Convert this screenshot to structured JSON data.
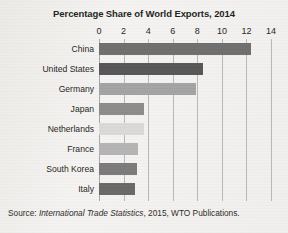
{
  "chart_data": {
    "type": "bar",
    "orientation": "horizontal",
    "title": "Percentage Share of World Exports, 2014",
    "xlabel": "",
    "ylabel": "",
    "xlim": [
      0,
      14
    ],
    "xticks": [
      0,
      2,
      4,
      6,
      8,
      10,
      12,
      14
    ],
    "grid": true,
    "legend": "none",
    "categories": [
      "China",
      "United States",
      "Germany",
      "Japan",
      "Netherlands",
      "France",
      "South Korea",
      "Italy"
    ],
    "values": [
      12.4,
      8.5,
      7.9,
      3.7,
      3.7,
      3.2,
      3.1,
      2.9
    ],
    "bar_colors": [
      "#6e6e6e",
      "#565656",
      "#a3a3a3",
      "#8b8b8b",
      "#d9d9d9",
      "#b4b4b4",
      "#7a7a7a",
      "#686868"
    ]
  },
  "source": {
    "prefix": "Source: ",
    "italic_title": "International Trade Statistics",
    "suffix": ", 2015, WTO Publications."
  },
  "colors": {
    "page_background": "#f1efed",
    "text": "#231f20",
    "gridline": "#b9b7b4"
  }
}
